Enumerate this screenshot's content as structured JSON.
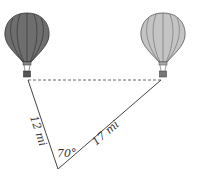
{
  "diagram": {
    "type": "triangle-word-problem",
    "objects": [
      {
        "name": "left-balloon",
        "fill": "#6e6e6e"
      },
      {
        "name": "right-balloon",
        "fill": "#bdbdbd"
      }
    ],
    "labels": {
      "left_side": "12 mi",
      "right_side": "17 mi",
      "angle": "70°"
    },
    "colors": {
      "line": "#444444",
      "dashed": "#666666",
      "dark_balloon": "#6e6e6e",
      "light_balloon": "#bdbdbd"
    }
  }
}
